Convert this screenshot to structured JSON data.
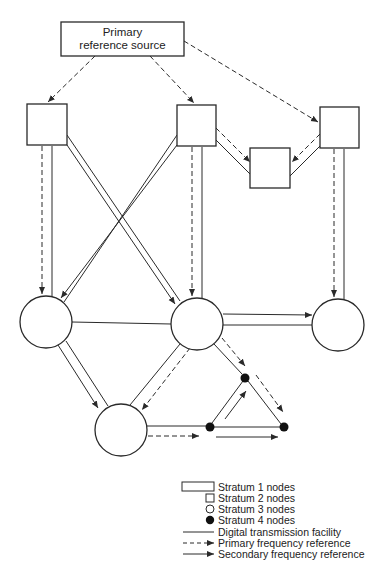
{
  "diagram": {
    "type": "network synchronization hierarchy",
    "colors": {
      "stroke": "#2a2a2a",
      "fill": "#ffffff",
      "stratum4_fill": "#111111"
    },
    "primary_source": {
      "line1": "Primary",
      "line2": "reference source"
    },
    "nodes": {
      "stratum2": [
        "left",
        "center",
        "right",
        "middle-small"
      ],
      "stratum3": [
        "left",
        "center",
        "right",
        "bottom-left"
      ],
      "stratum4": [
        "dot-top",
        "dot-left",
        "dot-right"
      ]
    }
  },
  "legend": {
    "items": [
      {
        "symbol": "wide-rectangle",
        "label": "Stratum 1 nodes"
      },
      {
        "symbol": "square",
        "label": "Stratum 2 nodes"
      },
      {
        "symbol": "open-circle",
        "label": "Stratum 3 nodes"
      },
      {
        "symbol": "filled-circle",
        "label": "Stratum 4 nodes"
      },
      {
        "symbol": "solid-line",
        "label": "Digital transmission facility"
      },
      {
        "symbol": "dashed-arrow",
        "label": "Primary frequency reference"
      },
      {
        "symbol": "solid-arrow",
        "label": "Secondary frequency reference"
      }
    ]
  }
}
